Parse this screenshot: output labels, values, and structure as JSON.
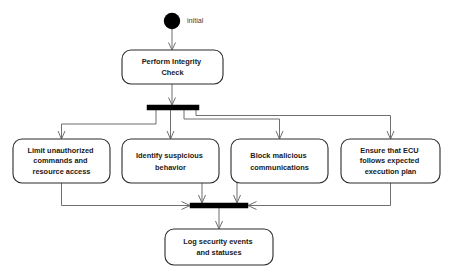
{
  "diagram": {
    "type": "uml-activity-diagram",
    "title": "",
    "background_color": "#ffffff",
    "line_color": "#6f6f6f",
    "box_stroke_color": "#2b2b2b",
    "bar_color": "#000000",
    "text_color": "#1a1a1a"
  },
  "initial_node": {
    "shape": "filled-circle",
    "label": "initial",
    "cx": 172,
    "cy": 21,
    "r": 8
  },
  "nodes": [
    {
      "id": "perform-integrity-check",
      "lines": [
        "Perform Integrity",
        "Check"
      ],
      "x": 122,
      "y": 50,
      "w": 101,
      "h": 34
    },
    {
      "id": "limit-unauthorized-commands",
      "lines": [
        "Limit unauthorized",
        "commands and",
        "resource access"
      ],
      "x": 13,
      "y": 139,
      "w": 97,
      "h": 44
    },
    {
      "id": "identify-suspicious-behavior",
      "lines": [
        "Identify suspicious",
        "behavior"
      ],
      "x": 122,
      "y": 139,
      "w": 97,
      "h": 44
    },
    {
      "id": "block-malicious-communications",
      "lines": [
        "Block malicious",
        "communications"
      ],
      "x": 231,
      "y": 139,
      "w": 97,
      "h": 44
    },
    {
      "id": "ensure-ecu-execution-plan",
      "lines": [
        "Ensure that ECU",
        "follows expected",
        "execution plan"
      ],
      "x": 341,
      "y": 139,
      "w": 99,
      "h": 44
    },
    {
      "id": "log-security-events",
      "lines": [
        "Log security events",
        "and statuses"
      ],
      "x": 165,
      "y": 229,
      "w": 108,
      "h": 36
    }
  ],
  "bars": [
    {
      "id": "fork-bar",
      "kind": "fork",
      "x": 147,
      "y": 105,
      "w": 52,
      "h": 5
    },
    {
      "id": "join-bar",
      "kind": "join",
      "x": 190,
      "y": 203,
      "w": 58,
      "h": 5
    }
  ],
  "edges": [
    {
      "id": "edge-initial-to-check",
      "from": "initial",
      "to": "perform-integrity-check"
    },
    {
      "id": "edge-check-to-fork",
      "from": "perform-integrity-check",
      "to": "fork-bar"
    },
    {
      "id": "edge-fork-to-limit",
      "from": "fork-bar",
      "to": "limit-unauthorized-commands"
    },
    {
      "id": "edge-fork-to-identify",
      "from": "fork-bar",
      "to": "identify-suspicious-behavior"
    },
    {
      "id": "edge-fork-to-block",
      "from": "fork-bar",
      "to": "block-malicious-communications"
    },
    {
      "id": "edge-fork-to-ensure",
      "from": "fork-bar",
      "to": "ensure-ecu-execution-plan"
    },
    {
      "id": "edge-limit-to-join",
      "from": "limit-unauthorized-commands",
      "to": "join-bar"
    },
    {
      "id": "edge-identify-to-join",
      "from": "identify-suspicious-behavior",
      "to": "join-bar"
    },
    {
      "id": "edge-block-to-join",
      "from": "block-malicious-communications",
      "to": "join-bar"
    },
    {
      "id": "edge-ensure-to-join",
      "from": "ensure-ecu-execution-plan",
      "to": "join-bar"
    },
    {
      "id": "edge-join-to-log",
      "from": "join-bar",
      "to": "log-security-events"
    }
  ]
}
